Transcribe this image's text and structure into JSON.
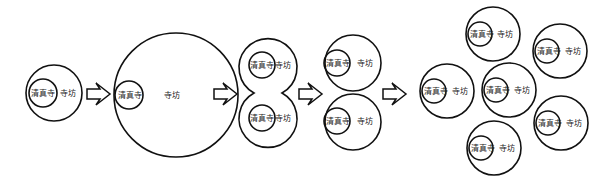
{
  "labels": {
    "mosque": "清真寺",
    "quarter": "寺坊"
  },
  "stages": [
    {
      "id": 1,
      "description": "Single mosque within a small quarter"
    },
    {
      "id": 2,
      "description": "Quarter expands"
    },
    {
      "id": 3,
      "description": "Quarter splits into two"
    },
    {
      "id": 4,
      "description": "Two separate quarters"
    },
    {
      "id": 5,
      "description": "Multiple quarters, each with a mosque"
    }
  ],
  "arrow_count": 4,
  "colors": {
    "stroke": "#111111",
    "background": "#ffffff"
  }
}
